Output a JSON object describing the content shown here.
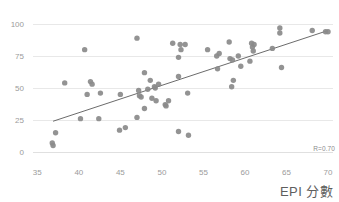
{
  "chart": {
    "title": "",
    "r_annotation": "R=0.70",
    "xaxis_title": "EPI 分數",
    "point_color": "#8a8a8a",
    "trendline_color": "#5a5a5a",
    "grid_color": "#e8e8e8",
    "tick_label_color": "#9b9b9b"
  },
  "chart_data": {
    "type": "scatter",
    "title": "",
    "xlabel": "EPI 分數",
    "ylabel": "",
    "xlim": [
      34.0,
      70.6
    ],
    "ylim": [
      -4,
      104
    ],
    "xticks": [
      35,
      40,
      45,
      50,
      55,
      60,
      65,
      70
    ],
    "yticks": [
      0,
      25,
      50,
      75,
      100
    ],
    "grid": "horizontal",
    "legend": "none",
    "annotations": [
      {
        "text": "R=0.70",
        "position": "bottom-right"
      }
    ],
    "trendline": {
      "type": "linear",
      "x_start": 36.9,
      "y_start": 24.0,
      "x_end": 70.0,
      "y_end": 95.0,
      "slope": 2.14,
      "intercept": -55.0,
      "r": 0.7
    },
    "points": [
      {
        "x": 36.8,
        "y": 7.0
      },
      {
        "x": 36.9,
        "y": 5.0
      },
      {
        "x": 37.2,
        "y": 15.0
      },
      {
        "x": 38.3,
        "y": 54.0
      },
      {
        "x": 40.2,
        "y": 26.0
      },
      {
        "x": 40.7,
        "y": 80.0
      },
      {
        "x": 41.0,
        "y": 45.0
      },
      {
        "x": 41.4,
        "y": 55.0
      },
      {
        "x": 41.6,
        "y": 53.0
      },
      {
        "x": 42.4,
        "y": 26.0
      },
      {
        "x": 42.6,
        "y": 46.0
      },
      {
        "x": 44.9,
        "y": 17.0
      },
      {
        "x": 45.0,
        "y": 45.0
      },
      {
        "x": 45.6,
        "y": 19.0
      },
      {
        "x": 47.0,
        "y": 89.0
      },
      {
        "x": 47.0,
        "y": 27.0
      },
      {
        "x": 47.2,
        "y": 48.0
      },
      {
        "x": 47.3,
        "y": 44.0
      },
      {
        "x": 47.5,
        "y": 43.0
      },
      {
        "x": 47.9,
        "y": 62.0
      },
      {
        "x": 47.9,
        "y": 34.0
      },
      {
        "x": 48.3,
        "y": 49.0
      },
      {
        "x": 48.6,
        "y": 56.0
      },
      {
        "x": 48.8,
        "y": 42.0
      },
      {
        "x": 49.1,
        "y": 51.0
      },
      {
        "x": 49.2,
        "y": 50.0
      },
      {
        "x": 49.3,
        "y": 40.0
      },
      {
        "x": 49.6,
        "y": 53.0
      },
      {
        "x": 50.4,
        "y": 37.0
      },
      {
        "x": 50.5,
        "y": 36.0
      },
      {
        "x": 50.8,
        "y": 40.0
      },
      {
        "x": 51.3,
        "y": 85.0
      },
      {
        "x": 52.0,
        "y": 74.0
      },
      {
        "x": 52.0,
        "y": 59.0
      },
      {
        "x": 52.0,
        "y": 16.0
      },
      {
        "x": 52.2,
        "y": 84.0
      },
      {
        "x": 52.3,
        "y": 80.0
      },
      {
        "x": 52.8,
        "y": 84.0
      },
      {
        "x": 53.1,
        "y": 46.0
      },
      {
        "x": 53.2,
        "y": 13.0
      },
      {
        "x": 55.5,
        "y": 80.0
      },
      {
        "x": 56.6,
        "y": 75.0
      },
      {
        "x": 56.7,
        "y": 65.0
      },
      {
        "x": 56.9,
        "y": 77.0
      },
      {
        "x": 58.1,
        "y": 86.0
      },
      {
        "x": 58.2,
        "y": 73.0
      },
      {
        "x": 58.4,
        "y": 51.0
      },
      {
        "x": 58.5,
        "y": 72.0
      },
      {
        "x": 58.6,
        "y": 56.0
      },
      {
        "x": 59.2,
        "y": 75.0
      },
      {
        "x": 59.5,
        "y": 67.0
      },
      {
        "x": 60.6,
        "y": 71.0
      },
      {
        "x": 60.8,
        "y": 85.0
      },
      {
        "x": 60.9,
        "y": 82.0
      },
      {
        "x": 61.0,
        "y": 79.0
      },
      {
        "x": 61.1,
        "y": 84.0
      },
      {
        "x": 63.3,
        "y": 81.0
      },
      {
        "x": 64.2,
        "y": 97.0
      },
      {
        "x": 64.2,
        "y": 93.0
      },
      {
        "x": 64.4,
        "y": 66.0
      },
      {
        "x": 68.1,
        "y": 95.0
      },
      {
        "x": 69.7,
        "y": 94.0
      },
      {
        "x": 70.0,
        "y": 94.0
      }
    ]
  }
}
